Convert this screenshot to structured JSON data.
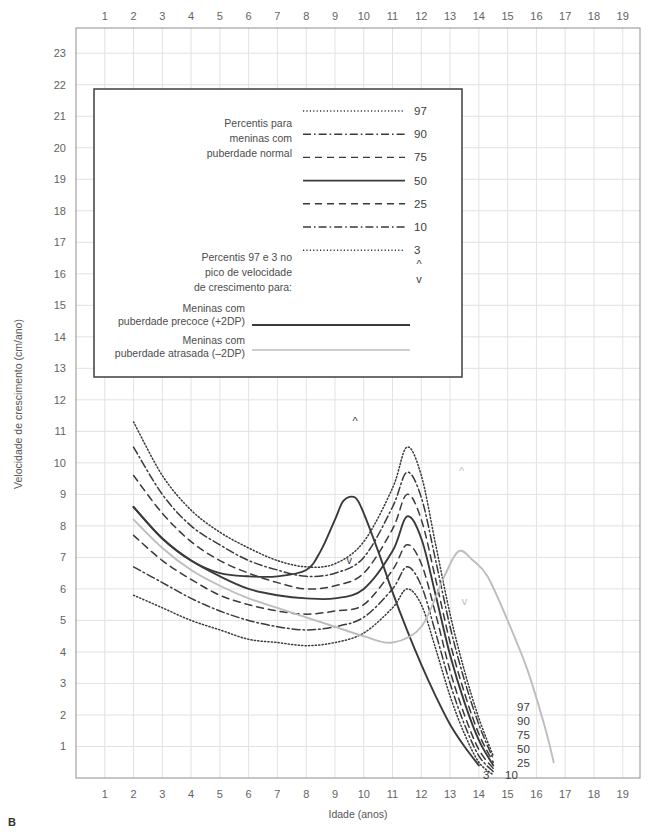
{
  "panel": {
    "letter": "B"
  },
  "axes": {
    "x_title": "Idade (anos)",
    "y_title": "Velocidade de crescimento (cm/ano)",
    "x_ticks": [
      1,
      2,
      3,
      4,
      5,
      6,
      7,
      8,
      9,
      10,
      11,
      12,
      13,
      14,
      15,
      16,
      17,
      18,
      19
    ],
    "y_ticks": [
      1,
      2,
      3,
      4,
      5,
      6,
      7,
      8,
      9,
      10,
      11,
      12,
      13,
      14,
      15,
      16,
      17,
      18,
      19,
      20,
      21,
      22,
      23
    ],
    "xlim": [
      0,
      19.6
    ],
    "ylim": [
      0,
      23.8
    ],
    "grid": true
  },
  "legend": {
    "title_normal": [
      "Percentis para",
      "meninas com",
      "puberdade normal"
    ],
    "percentile_labels": [
      "97",
      "90",
      "75",
      "50",
      "25",
      "10",
      "3"
    ],
    "title_peak": [
      "Percentis 97 e 3 no",
      "pico de velocidade",
      "de crescimento para:"
    ],
    "marker_up": "^",
    "marker_down": "v",
    "early_label": [
      "Meninas com",
      "puberdade precoce (+2DP)"
    ],
    "late_label": [
      "Meninas com",
      "puberdade atrasada (–2DP)"
    ]
  },
  "curve_end_labels": {
    "p97": "97",
    "p90": "90",
    "p75": "75",
    "p50": "50",
    "p25": "25",
    "p3": "3",
    "p10": "10"
  },
  "colors": {
    "grid": "#e2e2e2",
    "frame": "#9a9a9a",
    "curve_dark": "#3a3a3a",
    "curve_gray": "#bdbdbd",
    "legend_border": "#4a4a4a",
    "text": "#4a4a4a"
  },
  "chart_data": {
    "type": "line",
    "xlabel": "Idade (anos)",
    "ylabel": "Velocidade de crescimento (cm/ano)",
    "xlim": [
      0,
      19.6
    ],
    "ylim": [
      0,
      23.8
    ],
    "grid": true,
    "legend_position": "inset-top-left",
    "x": [
      2,
      3,
      4,
      5,
      6,
      7,
      8,
      9,
      10,
      11,
      11.5,
      12,
      12.5,
      13,
      13.5,
      14,
      14.5
    ],
    "series": [
      {
        "name": "97",
        "style": "dotted",
        "color": "#3a3a3a",
        "values": [
          11.3,
          9.6,
          8.5,
          7.8,
          7.3,
          6.9,
          6.7,
          6.8,
          7.5,
          9.2,
          10.5,
          9.6,
          7.4,
          5.2,
          3.4,
          1.9,
          0.7
        ]
      },
      {
        "name": "90",
        "style": "dash-dot",
        "color": "#3a3a3a",
        "values": [
          10.5,
          9.0,
          8.0,
          7.4,
          6.9,
          6.6,
          6.4,
          6.5,
          7.0,
          8.6,
          9.7,
          8.9,
          6.9,
          4.8,
          3.1,
          1.7,
          0.6
        ]
      },
      {
        "name": "75",
        "style": "dashed",
        "color": "#3a3a3a",
        "values": [
          9.6,
          8.4,
          7.5,
          6.9,
          6.5,
          6.2,
          6.0,
          6.1,
          6.5,
          7.9,
          9.0,
          8.2,
          6.3,
          4.3,
          2.7,
          1.4,
          0.5
        ]
      },
      {
        "name": "50",
        "style": "solid",
        "color": "#3a3a3a",
        "values": [
          8.6,
          7.6,
          6.9,
          6.4,
          6.0,
          5.8,
          5.7,
          5.7,
          6.0,
          7.2,
          8.3,
          7.6,
          5.8,
          3.9,
          2.4,
          1.2,
          0.4
        ]
      },
      {
        "name": "25",
        "style": "dashed",
        "color": "#3a3a3a",
        "values": [
          7.7,
          6.9,
          6.3,
          5.8,
          5.5,
          5.3,
          5.2,
          5.3,
          5.5,
          6.6,
          7.4,
          6.8,
          5.2,
          3.4,
          2.0,
          0.9,
          0.3
        ]
      },
      {
        "name": "10",
        "style": "dash-dot",
        "color": "#3a3a3a",
        "values": [
          6.7,
          6.2,
          5.7,
          5.3,
          5.0,
          4.8,
          4.7,
          4.8,
          5.1,
          6.0,
          6.7,
          6.1,
          4.6,
          3.0,
          1.7,
          0.7,
          0.2
        ]
      },
      {
        "name": "3",
        "style": "dotted",
        "color": "#3a3a3a",
        "values": [
          5.8,
          5.4,
          5.0,
          4.7,
          4.4,
          4.3,
          4.2,
          4.3,
          4.6,
          5.4,
          6.0,
          5.5,
          4.1,
          2.6,
          1.4,
          0.5,
          0.1
        ]
      },
      {
        "name": "puberdade precoce (+2DP) - percentil 97",
        "style": "solid",
        "color": "#3a3a3a",
        "note": "pico precoce em ~9.7 anos",
        "x": [
          2,
          3,
          4,
          5,
          6,
          7,
          8,
          8.5,
          9,
          9.3,
          9.7,
          10,
          10.5,
          11,
          11.5,
          12,
          12.5,
          13,
          13.5,
          14
        ],
        "values": [
          8.6,
          7.6,
          6.9,
          6.5,
          6.4,
          6.4,
          6.6,
          7.2,
          8.2,
          8.8,
          8.9,
          8.4,
          7.2,
          5.9,
          4.7,
          3.6,
          2.6,
          1.7,
          1.0,
          0.4
        ]
      },
      {
        "name": "puberdade atrasada (-2DP) - percentil 3",
        "style": "solid",
        "color": "#bdbdbd",
        "note": "pico tardio em ~13.3 anos",
        "x": [
          2,
          3,
          4,
          5,
          6,
          7,
          8,
          9,
          10,
          11,
          12,
          12.8,
          13.3,
          13.8,
          14.3,
          15,
          15.7,
          16.3,
          16.6
        ],
        "values": [
          8.2,
          7.3,
          6.6,
          6.1,
          5.7,
          5.4,
          5.1,
          4.8,
          4.5,
          4.3,
          4.8,
          6.4,
          7.2,
          6.9,
          6.4,
          5.0,
          3.4,
          1.6,
          0.5
        ]
      }
    ],
    "annotations": [
      {
        "glyph": "^",
        "x": 9.7,
        "y": 11.2,
        "color": "#3a3a3a",
        "meaning": "pico precoce superior"
      },
      {
        "glyph": "v",
        "x": 9.5,
        "y": 6.8,
        "color": "#3a3a3a",
        "meaning": "pico precoce inferior"
      },
      {
        "glyph": "^",
        "x": 13.4,
        "y": 9.6,
        "color": "#bdbdbd",
        "meaning": "pico atrasado superior"
      },
      {
        "glyph": "v",
        "x": 13.5,
        "y": 5.5,
        "color": "#bdbdbd",
        "meaning": "pico atrasado inferior"
      }
    ]
  }
}
